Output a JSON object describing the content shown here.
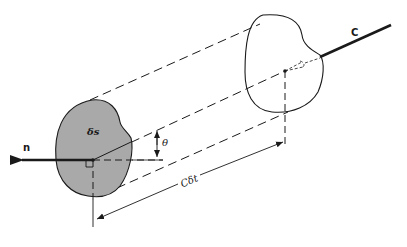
{
  "figure": {
    "labels": {
      "normal": "n",
      "area_element": "δs",
      "angle": "θ",
      "distance": "Cδt",
      "wave_direction": "C"
    },
    "colors": {
      "shaded_area": "#a9a9a9",
      "line": "#1a1a1a",
      "background": "#ffffff"
    }
  }
}
